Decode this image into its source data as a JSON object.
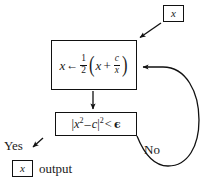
{
  "diagram": {
    "background_color": "#ffffff",
    "stroke_color": "#111111",
    "nodes": {
      "input": {
        "name": "input-token",
        "text": "x",
        "shape": "rect"
      },
      "update": {
        "name": "assignment-step",
        "formula_plain": "x <- 1/2 ( x + c/x )",
        "lhs": "x",
        "assign_arrow": "←",
        "coefficient_numerator": "1",
        "coefficient_denominator": "2",
        "paren_open": "(",
        "inner_first": "x",
        "inner_operator": "+",
        "fraction_numerator": "c",
        "fraction_denominator": "x",
        "paren_close": ")",
        "shape": "rect"
      },
      "condition": {
        "name": "convergence-test",
        "text_plain": "|x^2 - c|^2 < ϵ",
        "bar_left": "|",
        "term_base": "x",
        "term_exponent": "2",
        "minus": "–",
        "subtrahend": "c",
        "bar_right": "|",
        "outer_exponent": "2",
        "relation": "<",
        "tolerance": "ϵ",
        "shape": "rect"
      },
      "output": {
        "name": "output-token",
        "text": "x",
        "shape": "rect"
      }
    },
    "edge_labels": {
      "yes": "Yes",
      "no": "No"
    },
    "captions": {
      "output": "output"
    }
  }
}
